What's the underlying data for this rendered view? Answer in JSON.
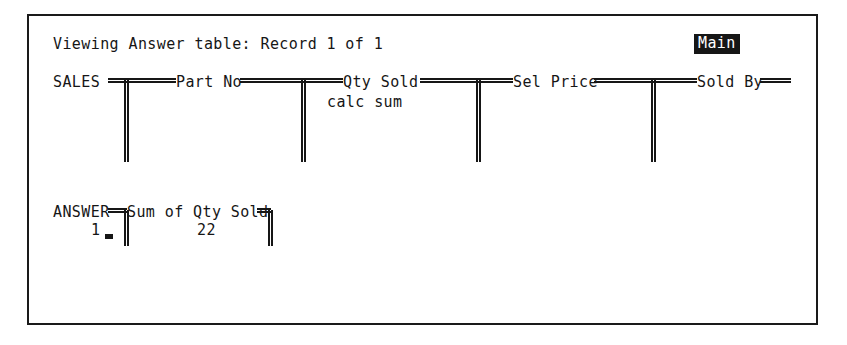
{
  "window": {
    "title_bar": {
      "status_text": "Viewing Answer table: Record 1 of 1",
      "mode_badge": "Main"
    }
  },
  "sales_table": {
    "table_name": "SALES",
    "columns": [
      {
        "label": "Part No"
      },
      {
        "label": "Qty Sold",
        "subtext": "calc sum"
      },
      {
        "label": "Sel Price"
      },
      {
        "label": "Sold By"
      }
    ]
  },
  "answer_table": {
    "table_name": "ANSWER",
    "columns": [
      {
        "label": "Sum of Qty Sold"
      }
    ],
    "rows": [
      {
        "record_number": "1",
        "values": [
          "22"
        ]
      }
    ]
  },
  "colors": {
    "foreground": "#161616",
    "background": "#ffffff",
    "badge_background": "#161616",
    "badge_foreground": "#ffffff"
  }
}
